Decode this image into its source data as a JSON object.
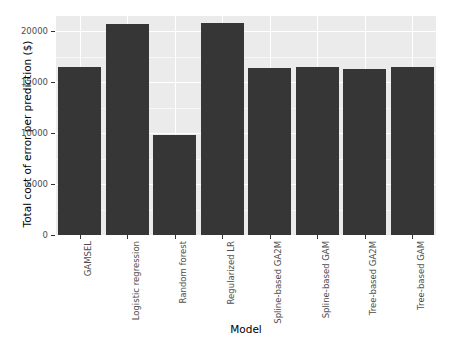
{
  "chart_data": {
    "type": "bar",
    "title": "",
    "subtitle": "",
    "xlabel": "Model",
    "ylabel": "Total cost of error per prediction ($)",
    "categories": [
      "GAMSEL",
      "Logistic regression",
      "Random forest",
      "Regularized LR",
      "Spline-based GA2M",
      "Spline-based GAM",
      "Tree-based GA2M",
      "Tree-based GAM"
    ],
    "values": [
      16450,
      20750,
      9850,
      20800,
      16430,
      16480,
      16330,
      16470
    ],
    "ylim": [
      0,
      21500
    ],
    "yticks": [
      0,
      5000,
      10000,
      15000,
      20000
    ],
    "ytick_labels": [
      "0",
      "5000",
      "10000",
      "15000",
      "20000"
    ],
    "grid": true,
    "legend": "none",
    "bar_color": "#363636",
    "panel_background": "#ebebeb",
    "gridline_color": "#ffffff",
    "axis_text_color": "#4d4d4d",
    "axis_title_color": "#000000"
  }
}
